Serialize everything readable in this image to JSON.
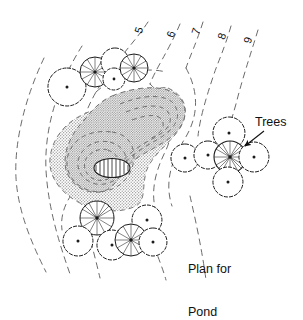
{
  "drawing": {
    "title": "Plan for Pond",
    "type": "landscape-site-plan",
    "style": "black-and-white line drawing, dashed contour lines, stippled pond fill",
    "canvas": {
      "width": 303,
      "height": 282,
      "background": "#ffffff"
    }
  },
  "colors": {
    "ink": "#111111",
    "contour_line": "#555555",
    "stipple": "#9a9a9a",
    "pond_fill_light": "#d9d9d9",
    "pond_fill_mid": "#c9c9c9",
    "paper": "#ffffff"
  },
  "labels": {
    "trees": "Trees",
    "caption_line1": "Plan for",
    "caption_line2": "Pond"
  },
  "contours": {
    "note": "elevation contour lines labelled at top of drawing, digits rotated to run with the line",
    "items": [
      {
        "value": "5",
        "x": 139,
        "y": 30,
        "rotate": -72
      },
      {
        "value": "6",
        "x": 171,
        "y": 33,
        "rotate": -72
      },
      {
        "value": "7",
        "x": 196,
        "y": 31,
        "rotate": -72
      },
      {
        "value": "8",
        "x": 222,
        "y": 35,
        "rotate": -72
      },
      {
        "value": "9",
        "x": 248,
        "y": 39,
        "rotate": -72
      }
    ]
  },
  "pond": {
    "name": "pond",
    "fill": "stipple",
    "island": {
      "name": "island",
      "cx": 112,
      "cy": 168,
      "rx": 18,
      "ry": 9
    }
  },
  "tree_groups": [
    {
      "name": "tree-group-upper-left",
      "trees": [
        {
          "cx": 67,
          "cy": 87,
          "r": 19,
          "symbol": "deciduous"
        },
        {
          "cx": 95,
          "cy": 72,
          "r": 15,
          "symbol": "conifer"
        },
        {
          "cx": 115,
          "cy": 62,
          "r": 14,
          "symbol": "deciduous"
        },
        {
          "cx": 114,
          "cy": 79,
          "r": 11,
          "symbol": "deciduous"
        },
        {
          "cx": 134,
          "cy": 68,
          "r": 14,
          "symbol": "conifer"
        }
      ]
    },
    {
      "name": "tree-group-right",
      "trees": [
        {
          "cx": 229,
          "cy": 133,
          "r": 16,
          "symbol": "deciduous"
        },
        {
          "cx": 185,
          "cy": 158,
          "r": 14,
          "symbol": "deciduous"
        },
        {
          "cx": 208,
          "cy": 155,
          "r": 14,
          "symbol": "deciduous"
        },
        {
          "cx": 230,
          "cy": 157,
          "r": 16,
          "symbol": "conifer"
        },
        {
          "cx": 254,
          "cy": 157,
          "r": 15,
          "symbol": "deciduous"
        },
        {
          "cx": 228,
          "cy": 182,
          "r": 15,
          "symbol": "deciduous"
        }
      ]
    },
    {
      "name": "tree-group-lower",
      "trees": [
        {
          "cx": 97,
          "cy": 218,
          "r": 17,
          "symbol": "conifer"
        },
        {
          "cx": 147,
          "cy": 220,
          "r": 15,
          "symbol": "deciduous"
        },
        {
          "cx": 78,
          "cy": 241,
          "r": 15,
          "symbol": "deciduous"
        },
        {
          "cx": 112,
          "cy": 245,
          "r": 15,
          "symbol": "deciduous"
        },
        {
          "cx": 131,
          "cy": 240,
          "r": 16,
          "symbol": "conifer"
        },
        {
          "cx": 153,
          "cy": 242,
          "r": 14,
          "symbol": "deciduous"
        }
      ]
    }
  ],
  "annotations": [
    {
      "name": "trees-callout",
      "text": "Trees",
      "arrow": {
        "from_x": 262,
        "from_y": 131,
        "to_x": 243,
        "to_y": 147
      }
    }
  ]
}
